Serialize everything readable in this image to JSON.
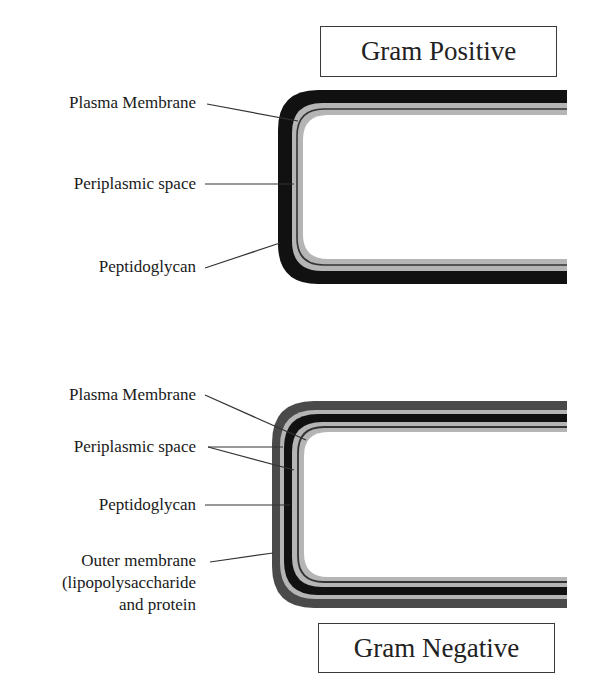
{
  "diagram": {
    "colors": {
      "black_layer": "#111111",
      "dark_gray_layer": "#4a4a4a",
      "light_gray_layer": "#b5b5b5",
      "thin_line": "#333333",
      "leader_line": "#333333"
    },
    "gram_positive": {
      "title": "Gram Positive",
      "labels": {
        "plasma_membrane": "Plasma Membrane",
        "periplasmic_space": "Periplasmic space",
        "peptidoglycan": "Peptidoglycan"
      },
      "layers_outer_to_inner": [
        "Peptidoglycan (thick)",
        "Periplasmic space",
        "Plasma Membrane"
      ]
    },
    "gram_negative": {
      "title": "Gram Negative",
      "labels": {
        "plasma_membrane": "Plasma Membrane",
        "periplasmic_space": "Periplasmic space",
        "peptidoglycan": "Peptidoglycan",
        "outer_membrane_line1": "Outer membrane",
        "outer_membrane_line2": "(lipopolysaccharide",
        "outer_membrane_line3": "and protein"
      },
      "layers_outer_to_inner": [
        "Outer membrane",
        "Periplasmic space",
        "Peptidoglycan (thin)",
        "Periplasmic space",
        "Plasma Membrane"
      ]
    }
  }
}
